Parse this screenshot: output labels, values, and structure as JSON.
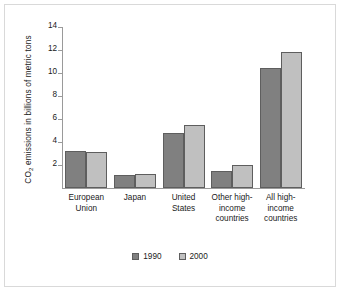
{
  "chart_data": {
    "type": "bar",
    "title": "",
    "xlabel": "",
    "ylabel": "CO2 emissions in billions of metric tons",
    "ylabel_prefix": "CO",
    "ylabel_sub": "2",
    "ylabel_suffix": " emissions in billions of metric tons",
    "categories": [
      "European Union",
      "Japan",
      "United States",
      "Other high-income countries",
      "All high-income countries"
    ],
    "category_lines": [
      [
        "European",
        "Union"
      ],
      [
        "Japan"
      ],
      [
        "United",
        "States"
      ],
      [
        "Other high-",
        "income",
        "countries"
      ],
      [
        "All high-",
        "income",
        "countries"
      ]
    ],
    "series": [
      {
        "name": "1990",
        "color": "#808080",
        "values": [
          3.2,
          1.1,
          4.8,
          1.5,
          10.4
        ]
      },
      {
        "name": "2000",
        "color": "#c0c0c0",
        "values": [
          3.1,
          1.2,
          5.5,
          2.0,
          11.8
        ]
      }
    ],
    "ylim": [
      0,
      14
    ],
    "yticks": [
      0,
      2,
      4,
      6,
      8,
      10,
      12,
      14
    ],
    "ytick_labels": [
      "",
      "2",
      "4",
      "6",
      "8",
      "10",
      "12",
      "14"
    ],
    "grid": false,
    "legend_position": "bottom-center"
  }
}
